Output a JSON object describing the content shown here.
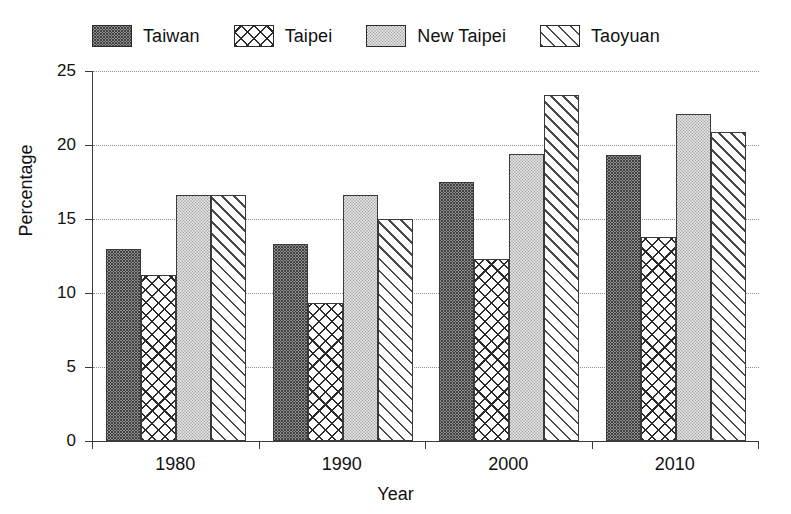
{
  "chart_data": {
    "type": "bar",
    "title": "",
    "xlabel": "Year",
    "ylabel": "Percentage",
    "categories": [
      "1980",
      "1990",
      "2000",
      "2010"
    ],
    "ylim": [
      0,
      25
    ],
    "yticks": [
      0,
      5,
      10,
      15,
      20,
      25
    ],
    "grid": true,
    "legend_position": "top",
    "series": [
      {
        "name": "Taiwan",
        "pattern": "dark-stipple",
        "values": [
          13.0,
          13.3,
          17.5,
          19.3
        ]
      },
      {
        "name": "Taipei",
        "pattern": "crosshatch",
        "values": [
          11.2,
          9.3,
          12.3,
          13.8
        ]
      },
      {
        "name": "New Taipei",
        "pattern": "light-stipple",
        "values": [
          16.6,
          16.6,
          19.4,
          22.1
        ]
      },
      {
        "name": "Taoyuan",
        "pattern": "diagonal-hatch",
        "values": [
          16.6,
          15.0,
          23.4,
          20.9
        ]
      }
    ]
  },
  "axis": {
    "y_tick_labels": [
      "25",
      "20",
      "15",
      "10",
      "5",
      "0"
    ],
    "y_title": "Percentage",
    "x_tick_labels": [
      "1980",
      "1990",
      "2000",
      "2010"
    ],
    "x_title": "Year"
  },
  "legend": {
    "entries": [
      {
        "label": "Taiwan",
        "swatch": "dark-stipple-swatch"
      },
      {
        "label": "Taipei",
        "swatch": "crosshatch-swatch"
      },
      {
        "label": "New Taipei",
        "swatch": "light-stipple-swatch"
      },
      {
        "label": "Taoyuan",
        "swatch": "diagonal-hatch-swatch"
      }
    ]
  },
  "colors": {
    "axis": "#3a3a3a",
    "grid": "#8c8c8c",
    "text": "#111111",
    "background": "#ffffff"
  }
}
